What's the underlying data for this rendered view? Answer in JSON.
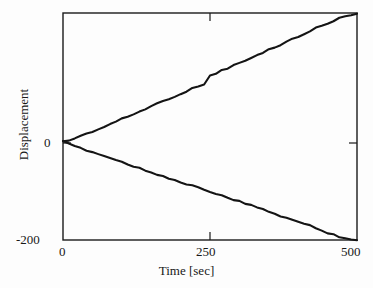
{
  "chart_data": {
    "type": "line",
    "title": "",
    "xlabel": "Time [sec]",
    "ylabel": "Displacement",
    "xlim": [
      0,
      500
    ],
    "ylim": [
      -200,
      262
    ],
    "xticks": [
      0,
      250,
      500
    ],
    "xtick_labels": [
      "0",
      "250",
      "500"
    ],
    "yticks": [
      0,
      -200
    ],
    "ytick_labels": [
      "0",
      "-200"
    ],
    "grid": false,
    "legend": null,
    "frame": "box",
    "line_color": "#141414",
    "background_color": "#fdfdfd",
    "series": [
      {
        "name": "upper branch",
        "x": [
          0,
          10,
          20,
          30,
          40,
          50,
          60,
          70,
          80,
          90,
          100,
          110,
          120,
          130,
          140,
          150,
          160,
          170,
          180,
          190,
          200,
          210,
          220,
          230,
          240,
          250,
          260,
          270,
          280,
          290,
          300,
          310,
          320,
          330,
          340,
          350,
          360,
          370,
          380,
          390,
          400,
          410,
          420,
          430,
          440,
          450,
          460,
          470,
          480,
          490,
          500
        ],
        "values": [
          0,
          3,
          7,
          12,
          16,
          21,
          26,
          30,
          36,
          41,
          46,
          51,
          56,
          61,
          67,
          72,
          78,
          82,
          88,
          92,
          98,
          103,
          108,
          113,
          118,
          134,
          139,
          145,
          150,
          155,
          160,
          165,
          170,
          176,
          181,
          187,
          192,
          198,
          203,
          209,
          214,
          220,
          225,
          231,
          236,
          241,
          246,
          251,
          255,
          259,
          262
        ]
      },
      {
        "name": "lower branch",
        "x": [
          0,
          10,
          20,
          30,
          40,
          50,
          60,
          70,
          80,
          90,
          100,
          110,
          120,
          130,
          140,
          150,
          160,
          170,
          180,
          190,
          200,
          210,
          220,
          230,
          240,
          250,
          260,
          270,
          280,
          290,
          300,
          310,
          320,
          330,
          340,
          350,
          360,
          370,
          380,
          390,
          400,
          410,
          420,
          430,
          440,
          450,
          460,
          470,
          480,
          490,
          500
        ],
        "values": [
          0,
          -5,
          -9,
          -13,
          -17,
          -21,
          -25,
          -29,
          -33,
          -37,
          -41,
          -45,
          -50,
          -54,
          -58,
          -62,
          -66,
          -70,
          -74,
          -78,
          -83,
          -87,
          -90,
          -94,
          -98,
          -101,
          -106,
          -110,
          -114,
          -118,
          -122,
          -126,
          -130,
          -134,
          -138,
          -142,
          -146,
          -151,
          -155,
          -159,
          -163,
          -167,
          -171,
          -176,
          -181,
          -185,
          -189,
          -193,
          -196,
          -198,
          -200
        ]
      }
    ]
  },
  "axes": {
    "ylabel_text": "Displacement",
    "xlabel_text": "Time [sec]",
    "ytick_zero": "0",
    "ytick_min": "-200",
    "xtick_zero": "0",
    "xtick_mid": "250",
    "xtick_max": "500"
  }
}
